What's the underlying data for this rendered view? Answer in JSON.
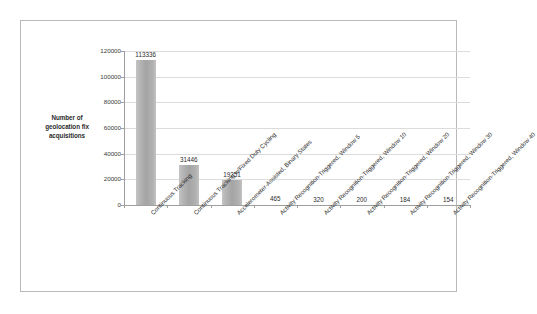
{
  "chart_data": {
    "type": "bar",
    "title": "",
    "subtitle": "",
    "xlabel": "",
    "ylabel": "Number of geolocation fix acquisitions",
    "ylim": [
      0,
      120000
    ],
    "ytick_values": [
      0,
      20000,
      40000,
      60000,
      80000,
      100000,
      120000
    ],
    "ytick_labels": [
      "0",
      "20000",
      "40000",
      "60000",
      "80000",
      "100000",
      "120000"
    ],
    "grid": true,
    "legend": "none",
    "orientation": "vertical",
    "bar_color": "#a8a8a8",
    "categories": [
      "Continuous Tracking",
      "Continuous Tracking w/Fixed Duty Cycling",
      "Accelerometer-Assisted, Binary States",
      "Activity Recognition-Triggered, Window 5",
      "Activity Recognition-Triggered, Window 10",
      "Activity Recognition-Triggered, Window 20",
      "Activity Recognition-Triggered, Window 30",
      "Activity Recognition-Triggered, Window 40"
    ],
    "values": [
      113336,
      31446,
      19251,
      465,
      320,
      200,
      184,
      154
    ],
    "data_labels": [
      "113336",
      "31446",
      "19251",
      "465",
      "320",
      "200",
      "184",
      "154"
    ]
  },
  "axis": {
    "y_title": "Number of geolocation fix acquisitions"
  }
}
